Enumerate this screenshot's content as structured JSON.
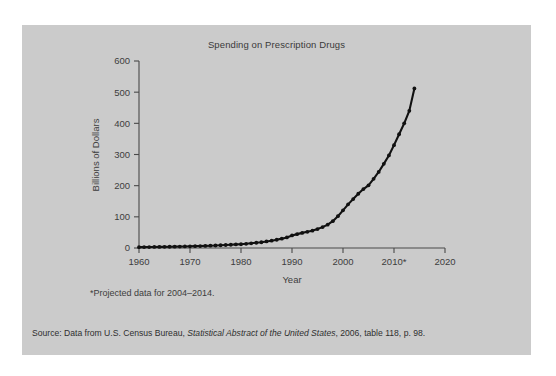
{
  "figure": {
    "background_color": "#cbcbcb",
    "page_color": "#ffffff",
    "line_color": "#111111",
    "text_color": "#3d3d3d",
    "title": "Spending on Prescription Drugs",
    "footnote": "*Projected data for 2004–2014.",
    "source": {
      "prefix": "Source: Data from U.S. Census Bureau, ",
      "italic": "Statistical Abstract of the United States",
      "suffix": ", 2006, table 118, p. 98."
    }
  },
  "chart_data": {
    "type": "line",
    "title": "Spending on Prescription Drugs",
    "xlabel": "Year",
    "ylabel": "Billions of Dollars",
    "xlim": [
      1960,
      2020
    ],
    "ylim": [
      0,
      600
    ],
    "xticks": [
      1960,
      1970,
      1980,
      1990,
      2000,
      2010,
      2020
    ],
    "xtick_labels": [
      "1960",
      "1970",
      "1980",
      "1990",
      "2000",
      "2010*",
      "2020"
    ],
    "yticks": [
      0,
      100,
      200,
      300,
      400,
      500,
      600
    ],
    "ytick_labels": [
      "0",
      "100",
      "200",
      "300",
      "400",
      "500",
      "600"
    ],
    "grid": false,
    "legend": null,
    "marker": "filled-circle",
    "annotations": [
      "*Projected data for 2004–2014."
    ],
    "series": [
      {
        "name": "Spending on prescription drugs",
        "x": [
          1960,
          1961,
          1962,
          1963,
          1964,
          1965,
          1966,
          1967,
          1968,
          1969,
          1970,
          1971,
          1972,
          1973,
          1974,
          1975,
          1976,
          1977,
          1978,
          1979,
          1980,
          1981,
          1982,
          1983,
          1984,
          1985,
          1986,
          1987,
          1988,
          1989,
          1990,
          1991,
          1992,
          1993,
          1994,
          1995,
          1996,
          1997,
          1998,
          1999,
          2000,
          2001,
          2002,
          2003,
          2004,
          2005,
          2006,
          2007,
          2008,
          2009,
          2010,
          2011,
          2012,
          2013,
          2014
        ],
        "values": [
          2.7,
          2.9,
          3.1,
          3.3,
          3.6,
          3.7,
          4.0,
          4.3,
          4.6,
          5.0,
          5.5,
          5.9,
          6.3,
          6.7,
          7.3,
          8.0,
          8.8,
          9.6,
          10.4,
          11.5,
          12.0,
          13.5,
          15.0,
          16.8,
          18.5,
          21.0,
          23.5,
          26.5,
          30.0,
          34.0,
          40.3,
          44.5,
          48.5,
          52.0,
          55.5,
          60.8,
          67.0,
          75.0,
          86.0,
          102.0,
          120.8,
          140.0,
          157.0,
          174.0,
          189.0,
          201.0,
          222.0,
          244.0,
          270.0,
          297.0,
          330.0,
          365.0,
          400.0,
          440.0,
          512.0
        ]
      }
    ]
  }
}
